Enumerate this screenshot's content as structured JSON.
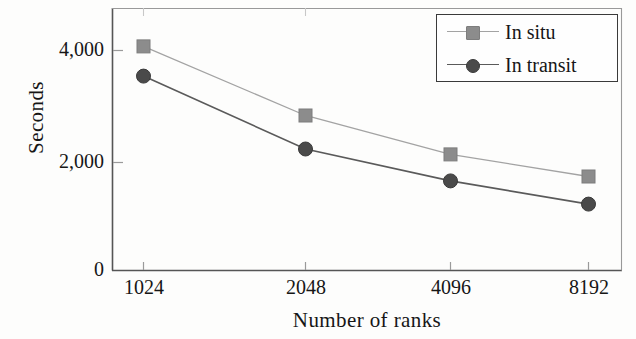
{
  "chart_data": {
    "type": "line",
    "title": "",
    "xlabel": "Number of ranks",
    "ylabel": "Seconds",
    "categories": [
      "1024",
      "2048",
      "4096",
      "8192"
    ],
    "x": [
      1024,
      2048,
      4096,
      8192
    ],
    "xtick_labels": [
      "1024",
      "2048",
      "4096",
      "8192"
    ],
    "ytick_labels": [
      "0",
      "2,000",
      "4,000"
    ],
    "yticks": [
      0,
      2000,
      4000
    ],
    "ylim": [
      0,
      4800
    ],
    "grid": false,
    "legend_position": "top-right",
    "series": [
      {
        "name": "In situ",
        "marker": "square",
        "color": "#8c8c8c",
        "line_color": "#a3a3a3",
        "values": [
          4150,
          2870,
          2150,
          1740
        ]
      },
      {
        "name": "In transit",
        "marker": "circle",
        "color": "#4a4a4a",
        "line_color": "#5a5a5a",
        "values": [
          3600,
          2250,
          1660,
          1230
        ]
      }
    ]
  },
  "axes": {
    "frame_color": "#555555"
  },
  "legend": {
    "entries": [
      {
        "label": "In situ"
      },
      {
        "label": "In transit"
      }
    ]
  }
}
